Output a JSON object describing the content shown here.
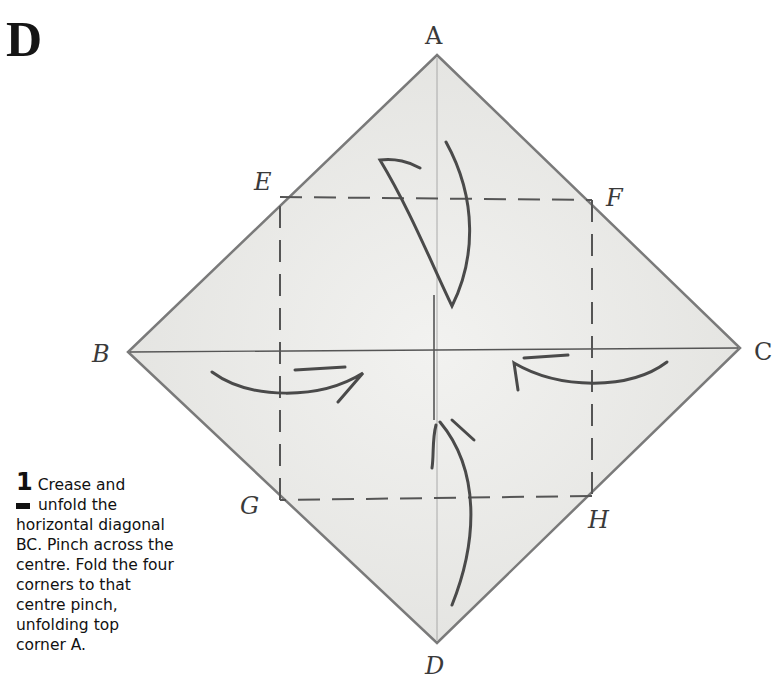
{
  "section": {
    "letter": "D"
  },
  "diagram": {
    "points": {
      "A": {
        "label": "A",
        "x": 437,
        "y": 55
      },
      "B": {
        "label": "B",
        "x": 128,
        "y": 352
      },
      "C": {
        "label": "C",
        "x": 740,
        "y": 348
      },
      "D": {
        "label": "D",
        "x": 437,
        "y": 643
      },
      "E": {
        "label": "E",
        "x": 280,
        "y": 196
      },
      "F": {
        "label": "F",
        "x": 592,
        "y": 200
      },
      "G": {
        "label": "G",
        "x": 280,
        "y": 500
      },
      "H": {
        "label": "H",
        "x": 592,
        "y": 496
      }
    },
    "colors": {
      "paper": "#e8e8e6",
      "edge": "#7a7a7a",
      "crease": "#555555",
      "arrow": "#4a4a4a"
    }
  },
  "step": {
    "number": "1",
    "text": "Crease and unfold the horizontal diagonal BC. Pinch across the centre. Fold the four corners to that centre pinch, unfolding top corner A.",
    "lines": [
      "Crease and",
      "unfold the",
      "horizontal diagonal",
      "BC. Pinch across the",
      "centre. Fold the four",
      "corners to that",
      "centre pinch,",
      "unfolding top",
      "corner A."
    ]
  }
}
